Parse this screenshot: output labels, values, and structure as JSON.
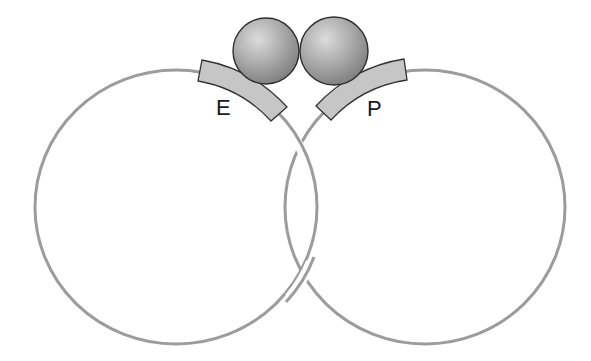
{
  "diagram": {
    "title": "",
    "labels": {
      "left_block": "E",
      "right_block": "P"
    },
    "elements": {
      "left_ring": {
        "cx": 176,
        "cy": 207,
        "rx": 141,
        "ry": 137
      },
      "right_ring": {
        "cx": 425,
        "cy": 207,
        "rx": 140,
        "ry": 137
      },
      "left_sphere": {
        "cx": 266,
        "cy": 51,
        "r": 33
      },
      "right_sphere": {
        "cx": 334,
        "cy": 51,
        "r": 34
      }
    },
    "colors": {
      "ring_stroke": "#9c9c9c",
      "block_fill": "#c6c6c6",
      "block_outline": "#333333",
      "sphere_light": "#dcdcdc",
      "sphere_dark": "#7a7a7a",
      "background": "#ffffff"
    }
  }
}
